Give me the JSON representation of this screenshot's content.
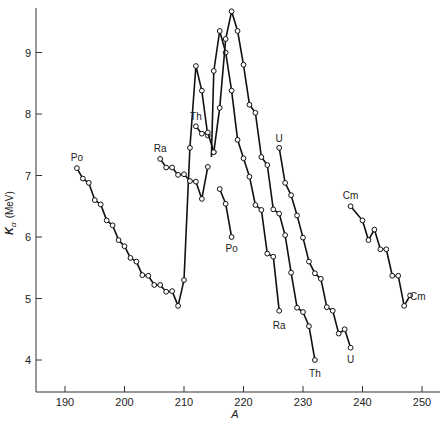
{
  "chart_data": {
    "type": "line",
    "title": "",
    "xlabel": "A",
    "ylabel": "K_α (MeV)",
    "ylabel_main": "K",
    "ylabel_sub": "α",
    "ylabel_unit": "(MeV)",
    "xlim": [
      185,
      253
    ],
    "ylim": [
      3.5,
      9.75
    ],
    "xticks": [
      190,
      200,
      210,
      220,
      230,
      240,
      250
    ],
    "yticks": [
      4,
      5,
      6,
      7,
      8,
      9
    ],
    "grid": false,
    "legend": "none (series labeled inline at curve ends)",
    "markers": "open circles",
    "series": [
      {
        "name": "Po",
        "segments": [
          {
            "x": [
              192,
              193,
              194,
              195,
              196,
              197,
              198,
              199,
              200,
              201,
              202,
              203,
              204,
              205,
              206,
              207,
              208,
              209,
              210,
              211,
              212,
              213,
              214
            ],
            "y": [
              7.12,
              6.95,
              6.88,
              6.6,
              6.53,
              6.27,
              6.19,
              5.95,
              5.85,
              5.66,
              5.6,
              5.38,
              5.37,
              5.22,
              5.22,
              5.11,
              5.12,
              4.88,
              5.3,
              7.45,
              8.78,
              8.38,
              7.65
            ]
          },
          {
            "x": [
              216,
              217,
              218
            ],
            "y": [
              6.78,
              6.54,
              6.0
            ]
          }
        ],
        "labels": [
          {
            "text": "Po",
            "x": 192,
            "y": 7.28
          },
          {
            "text": "Po",
            "x": 218,
            "y": 5.8
          }
        ]
      },
      {
        "name": "Ra",
        "segments": [
          {
            "x": [
              206,
              207,
              208,
              209,
              210,
              211,
              212,
              213,
              214
            ],
            "y": [
              7.27,
              7.13,
              7.13,
              7.01,
              7.02,
              6.91,
              6.9,
              6.62,
              7.14
            ]
          },
          {
            "x": [
              214.6,
              215,
              216,
              217,
              218,
              219,
              220,
              221,
              222,
              223,
              224,
              225,
              226
            ],
            "y": [
              7.3,
              8.7,
              9.35,
              9.0,
              8.38,
              7.58,
              7.28,
              6.98,
              6.52,
              6.44,
              5.73,
              5.68,
              4.8
            ]
          }
        ],
        "labels": [
          {
            "text": "Ra",
            "x": 206,
            "y": 7.43
          },
          {
            "text": "Ra",
            "x": 226,
            "y": 4.55
          }
        ]
      },
      {
        "name": "Th",
        "segments": [
          {
            "x": [
              212,
              213,
              214,
              215
            ],
            "y": [
              7.8,
              7.68,
              7.7,
              7.38
            ]
          },
          {
            "x": [
              215,
              216,
              217,
              218,
              219,
              220,
              221,
              222,
              223,
              224,
              225,
              226,
              227,
              228,
              229,
              230,
              231,
              232
            ],
            "y": [
              7.38,
              8.1,
              9.22,
              9.67,
              9.35,
              8.8,
              8.15,
              8.02,
              7.3,
              7.17,
              6.45,
              6.38,
              6.03,
              5.42,
              4.85,
              4.78,
              4.55,
              4.0
            ]
          }
        ],
        "labels": [
          {
            "text": "Th",
            "x": 212,
            "y": 7.95
          },
          {
            "text": "Th",
            "x": 232,
            "y": 3.78
          }
        ]
      },
      {
        "name": "U",
        "segments": [
          {
            "x": [
              226,
              227,
              228,
              229,
              230,
              231,
              232,
              233,
              234,
              235,
              236,
              237,
              238
            ],
            "y": [
              7.45,
              6.88,
              6.68,
              6.35,
              5.99,
              5.6,
              5.41,
              5.32,
              4.86,
              4.8,
              4.43,
              4.5,
              4.2
            ]
          }
        ],
        "labels": [
          {
            "text": "U",
            "x": 226,
            "y": 7.6
          },
          {
            "text": "U",
            "x": 238,
            "y": 4.0
          }
        ]
      },
      {
        "name": "Cm",
        "segments": [
          {
            "x": [
              238,
              240,
              241,
              242,
              243,
              244,
              245,
              246,
              247,
              248
            ],
            "y": [
              6.5,
              6.27,
              5.95,
              6.12,
              5.8,
              5.8,
              5.37,
              5.37,
              4.88,
              5.05
            ]
          }
        ],
        "labels": [
          {
            "text": "Cm",
            "x": 238,
            "y": 6.66
          },
          {
            "text": "Cm",
            "x": 249.3,
            "y": 5.02
          }
        ]
      }
    ],
    "style": {
      "line_color": "#111111",
      "marker_fill": "#ffffff",
      "axis_color": "#333333",
      "background": "#ffffff"
    }
  }
}
